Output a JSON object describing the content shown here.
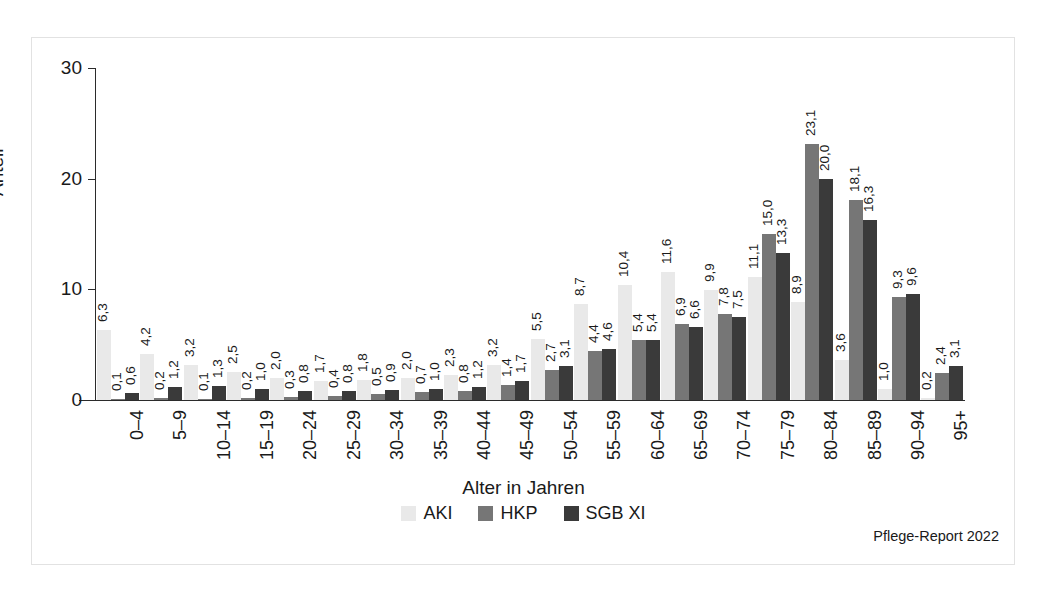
{
  "figure": {
    "y_axis_title": "Anteil",
    "x_axis_title": "Alter in Jahren",
    "footer_note": "Pflege-Report 2022"
  },
  "legend": {
    "items": [
      {
        "label": "AKI",
        "color": "#e9e9e9"
      },
      {
        "label": "HKP",
        "color": "#767676"
      },
      {
        "label": "SGB XI",
        "color": "#3a3a3a"
      }
    ]
  },
  "chart_data": {
    "type": "bar",
    "title": "",
    "subtitle": "",
    "xlabel": "Alter in Jahren",
    "ylabel": "Anteil",
    "ylim": [
      0,
      30
    ],
    "yticks": [
      0,
      10,
      20,
      30
    ],
    "ytick_labels": [
      "0",
      "10",
      "20",
      "30"
    ],
    "grid": false,
    "legend_position": "bottom",
    "decimal_separator": ",",
    "categories": [
      "0–4",
      "5–9",
      "10–14",
      "15–19",
      "20–24",
      "25–29",
      "30–34",
      "35–39",
      "40–44",
      "45–49",
      "50–54",
      "55–59",
      "60–64",
      "65–69",
      "70–74",
      "75–79",
      "80–84",
      "85–89",
      "90–94",
      "95+"
    ],
    "series": [
      {
        "name": "AKI",
        "color": "#e9e9e9",
        "values": [
          6.3,
          4.2,
          3.2,
          2.5,
          2.0,
          1.7,
          1.8,
          2.0,
          2.3,
          3.2,
          5.5,
          8.7,
          10.4,
          11.6,
          9.9,
          11.1,
          8.9,
          3.6,
          1.0,
          0.2
        ],
        "labels": [
          "6,3",
          "4,2",
          "3,2",
          "2,5",
          "2,0",
          "1,7",
          "1,8",
          "2,0",
          "2,3",
          "3,2",
          "5,5",
          "8,7",
          "10,4",
          "11,6",
          "9,9",
          "11,1",
          "8,9",
          "3,6",
          "1,0",
          "0,2"
        ]
      },
      {
        "name": "HKP",
        "color": "#767676",
        "values": [
          0.1,
          0.2,
          0.1,
          0.2,
          0.3,
          0.4,
          0.5,
          0.7,
          0.8,
          1.4,
          2.7,
          4.4,
          5.4,
          6.9,
          7.8,
          15.0,
          23.1,
          18.1,
          9.3,
          2.4
        ],
        "labels": [
          "0,1",
          "0,2",
          "0,1",
          "0,2",
          "0,3",
          "0,4",
          "0,5",
          "0,7",
          "0,8",
          "1,4",
          "2,7",
          "4,4",
          "5,4",
          "6,9",
          "7,8",
          "15,0",
          "23,1",
          "18,1",
          "9,3",
          "2,4"
        ]
      },
      {
        "name": "SGB XI",
        "color": "#3a3a3a",
        "values": [
          0.6,
          1.2,
          1.3,
          1.0,
          0.8,
          0.8,
          0.9,
          1.0,
          1.2,
          1.7,
          3.1,
          4.6,
          5.4,
          6.6,
          7.5,
          13.3,
          20.0,
          16.3,
          9.6,
          3.1
        ],
        "labels": [
          "0,6",
          "1,2",
          "1,3",
          "1,0",
          "0,8",
          "0,8",
          "0,9",
          "1,0",
          "1,2",
          "1,7",
          "3,1",
          "4,6",
          "5,4",
          "6,6",
          "7,5",
          "13,3",
          "20,0",
          "16,3",
          "9,6",
          "3,1"
        ]
      }
    ]
  }
}
